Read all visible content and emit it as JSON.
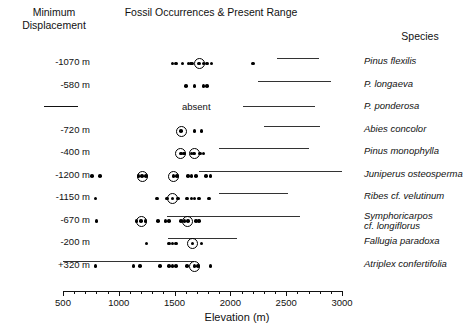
{
  "header": {
    "displacement_title": "Minimum\nDisplacement",
    "fossil_title": "Fossil Occurrences &\nPresent Range",
    "species_title": "Species"
  },
  "axis": {
    "label": "Elevation (m)",
    "min": 500,
    "max": 3000,
    "ticks": [
      500,
      1000,
      1500,
      2000,
      2500,
      3000
    ],
    "minor_tick_step": 100,
    "tick_labels": [
      "500",
      "1000",
      "1500",
      "2000",
      "2500",
      "3000"
    ]
  },
  "absent_label": "absent",
  "chart_data": {
    "type": "scatter",
    "title": "Fossil Occurrences & Present Range",
    "xlabel": "Elevation (m)",
    "ylabel": "Species",
    "xlim": [
      500,
      3000
    ],
    "grid": false,
    "legend": null,
    "annotations": [
      "absent"
    ],
    "columns": [
      "Minimum Displacement",
      "Fossil Occurrences & Present Range",
      "Species"
    ],
    "series": [
      {
        "species": "Pinus flexilis",
        "displacement": "-1070 m",
        "fossil_elevations": [
          1480,
          1510,
          1570,
          1625,
          1645,
          1660,
          1720,
          1760,
          1790,
          1830,
          2200
        ],
        "emphasized_elevations": [
          1720
        ],
        "present_range": [
          2420,
          2790
        ],
        "absent": false
      },
      {
        "species": "P. longaeva",
        "displacement": "-580 m",
        "fossil_elevations": [
          1600,
          1680,
          1760,
          1790
        ],
        "emphasized_elevations": [],
        "present_range": [
          2250,
          2900
        ],
        "absent": false
      },
      {
        "species": "P. ponderosa",
        "displacement": "—",
        "fossil_elevations": [],
        "emphasized_elevations": [],
        "present_range": [
          2110,
          2760
        ],
        "absent": true
      },
      {
        "species": "Abies concolor",
        "displacement": "-720 m",
        "fossil_elevations": [
          1560,
          1680,
          1740
        ],
        "emphasized_elevations": [
          1560
        ],
        "present_range": [
          2300,
          2800
        ],
        "absent": false
      },
      {
        "species": "Pinus monophylla",
        "displacement": "-400 m",
        "fossil_elevations": [
          1555,
          1585,
          1650,
          1675,
          1730,
          1760
        ],
        "emphasized_elevations": [
          1555,
          1675
        ],
        "present_range": [
          1900,
          2700
        ],
        "absent": false
      },
      {
        "species": "Juniperus osteosperma",
        "displacement": "-1200 m",
        "fossil_elevations": [
          760,
          830,
          1175,
          1210,
          1245,
          1490,
          1520,
          1620,
          1650,
          1690,
          1780,
          1820
        ],
        "emphasized_elevations": [
          1210,
          1490,
          1670
        ],
        "present_range": [
          1720,
          3000
        ],
        "absent": false
      },
      {
        "species": "Ribes cf. velutinum",
        "displacement": "-1150 m",
        "fossil_elevations": [
          790,
          1340,
          1430,
          1480,
          1530,
          1610,
          1650,
          1680,
          1720,
          1810
        ],
        "emphasized_elevations": [
          1480,
          1700
        ],
        "present_range": [
          1900,
          2520
        ],
        "absent": false
      },
      {
        "species": "Symphoricarpos\n  cf. longiflorus",
        "displacement": "-670 m",
        "fossil_elevations": [
          800,
          1160,
          1200,
          1240,
          1350,
          1420,
          1450,
          1560,
          1590,
          1620,
          1690,
          1720
        ],
        "emphasized_elevations": [
          1200,
          1620
        ],
        "present_range": [
          1430,
          2620
        ],
        "absent": false
      },
      {
        "species": "Fallugia paradoxa",
        "displacement": "-200 m",
        "fossil_elevations": [
          1250,
          1450,
          1480,
          1510,
          1660,
          1740
        ],
        "emphasized_elevations": [
          1660
        ],
        "present_range": [
          1440,
          2060
        ],
        "absent": false
      },
      {
        "species": "Atriplex confertifolia",
        "displacement": "+320 m",
        "fossil_elevations": [
          790,
          1130,
          1190,
          1370,
          1450,
          1480,
          1510,
          1610,
          1680,
          1710,
          1820
        ],
        "emphasized_elevations": [
          1680
        ],
        "present_range": [
          500,
          1670
        ],
        "absent": false
      }
    ]
  }
}
